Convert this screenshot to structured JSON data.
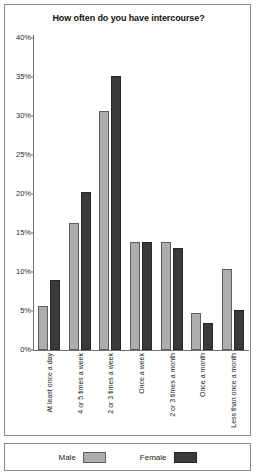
{
  "chart_data": {
    "type": "bar",
    "title": "How often do you have intercourse?",
    "xlabel": "",
    "ylabel": "",
    "ylim": [
      0,
      40
    ],
    "yticks": [
      0,
      5,
      10,
      15,
      20,
      25,
      30,
      35,
      40
    ],
    "ytick_labels": [
      "0%",
      "5%",
      "10%",
      "15%",
      "20%",
      "25%",
      "30%",
      "35%",
      "40%"
    ],
    "grid": false,
    "legend_position": "bottom",
    "categories": [
      "At least once a day",
      "4 or 5 times a week",
      "2 or 3 times a week",
      "Once a week",
      "2 or 3 times a month",
      "Once a month",
      "Less than once a month"
    ],
    "series": [
      {
        "name": "Male",
        "color": "#adadad",
        "values": [
          5.7,
          16.3,
          30.7,
          13.8,
          13.8,
          4.7,
          10.4
        ]
      },
      {
        "name": "Female",
        "color": "#3a3a3a",
        "values": [
          9.0,
          20.2,
          35.1,
          13.8,
          13.1,
          3.4,
          5.1
        ]
      }
    ]
  },
  "legend": {
    "items": [
      {
        "label": "Male",
        "swatch": "male"
      },
      {
        "label": "Female",
        "swatch": "female"
      }
    ]
  }
}
